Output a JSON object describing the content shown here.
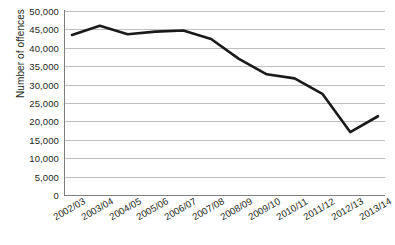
{
  "chart_data": {
    "type": "line",
    "title": "",
    "xlabel": "",
    "ylabel": "Number of offences",
    "categories": [
      "2002/03",
      "2003/04",
      "2004/05",
      "2005/06",
      "2006/07",
      "2007/08",
      "2008/09",
      "2009/10",
      "2010/11",
      "2011/12",
      "2012/13",
      "2013/14"
    ],
    "values": [
      43500,
      46000,
      43700,
      44400,
      44700,
      42400,
      37000,
      32800,
      31700,
      27500,
      17100,
      21400
    ],
    "series": [
      {
        "name": "Number of offences",
        "values": [
          43500,
          46000,
          43700,
          44400,
          44700,
          42400,
          37000,
          32800,
          31700,
          27500,
          17100,
          21400
        ]
      }
    ],
    "ylim": [
      0,
      50000
    ],
    "ytick_step": 5000,
    "ytick_labels": [
      "50,000",
      "45,000",
      "40,000",
      "35,000",
      "30,000",
      "25,000",
      "20,000",
      "15,000",
      "10,000",
      "5,000",
      "0"
    ],
    "ytick_values": [
      50000,
      45000,
      40000,
      35000,
      30000,
      25000,
      20000,
      15000,
      10000,
      5000,
      0
    ],
    "grid": true,
    "legend": false,
    "legend_position": "none",
    "line_color": "#1a1a1a",
    "grid_color": "#bfbfbf",
    "axis_color": "#7f7f7f",
    "text_color": "#231f20",
    "line_width": 2.6,
    "markers": false
  }
}
